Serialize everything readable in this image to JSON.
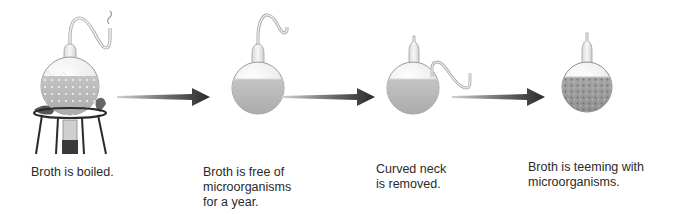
{
  "diagram": {
    "type": "process-sequence",
    "colors": {
      "background": "#ffffff",
      "arrow_dark": "#2e2e2e",
      "arrow_light": "#bdbdbd",
      "broth_clear": "#b9b9b9",
      "broth_contaminated": "#9a9a9a",
      "glass_outline": "#9e9e9e",
      "caption_text": "#2a2a2a"
    },
    "steps": [
      {
        "id": "step-1",
        "illustration": "boiling-flask-on-stand",
        "caption_lines": [
          "Broth is boiled."
        ]
      },
      {
        "id": "step-2",
        "illustration": "swan-neck-flask-sterile",
        "caption_lines": [
          "Broth is free of",
          "microorganisms",
          "for a year."
        ]
      },
      {
        "id": "step-3",
        "illustration": "flask-neck-removed",
        "caption_lines": [
          "Curved neck",
          "is removed."
        ]
      },
      {
        "id": "step-4",
        "illustration": "flask-contaminated",
        "caption_lines": [
          "Broth is teeming with",
          "microorganisms."
        ]
      }
    ],
    "arrows": [
      {
        "from": "step-1",
        "to": "step-2"
      },
      {
        "from": "step-2",
        "to": "step-3"
      },
      {
        "from": "step-3",
        "to": "step-4"
      }
    ]
  }
}
